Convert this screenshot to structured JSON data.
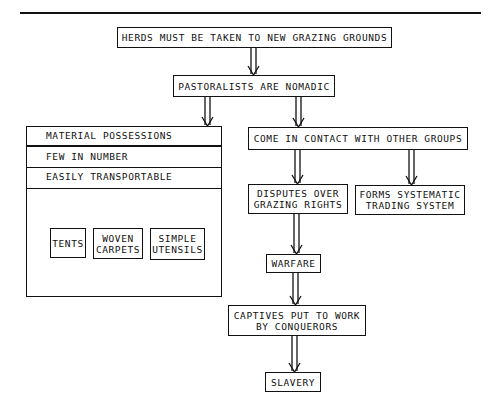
{
  "diagram": {
    "type": "flowchart",
    "nodes": {
      "herds": "HERDS MUST BE TAKEN TO NEW GRAZING GROUNDS",
      "pastoralists": "PASTORALISTS ARE NOMADIC",
      "material": {
        "rows": [
          "MATERIAL POSSESSIONS",
          "FEW IN NUMBER",
          "EASILY TRANSPORTABLE"
        ],
        "items": [
          "TENTS",
          "WOVEN\nCARPETS",
          "SIMPLE\nUTENSILS"
        ]
      },
      "contact": "COME IN CONTACT WITH OTHER GROUPS",
      "disputes": "DISPUTES OVER\nGRAZING RIGHTS",
      "trading": "FORMS SYSTEMATIC\nTRADING SYSTEM",
      "warfare": "WARFARE",
      "captives": "CAPTIVES PUT TO WORK\nBY CONQUERORS",
      "slavery": "SLAVERY"
    },
    "edges": [
      [
        "herds",
        "pastoralists"
      ],
      [
        "pastoralists",
        "material"
      ],
      [
        "pastoralists",
        "contact"
      ],
      [
        "contact",
        "disputes"
      ],
      [
        "contact",
        "trading"
      ],
      [
        "disputes",
        "warfare"
      ],
      [
        "warfare",
        "captives"
      ],
      [
        "captives",
        "slavery"
      ]
    ]
  }
}
